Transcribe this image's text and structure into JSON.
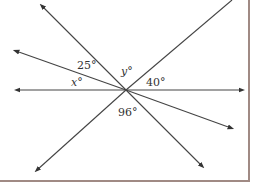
{
  "diagram": {
    "center": [
      126,
      90
    ],
    "line_color": "#444444",
    "border_color": "#a08a84",
    "lines": [
      {
        "name": "horizontal-line",
        "from": [
          17,
          90
        ],
        "to": [
          242,
          90
        ]
      },
      {
        "name": "steep-descending-line",
        "from": [
          42,
          6
        ],
        "to": [
          202,
          166
        ]
      },
      {
        "name": "shallow-descending-line",
        "from": [
          16,
          51
        ],
        "to": [
          231,
          128
        ]
      },
      {
        "name": "ascending-line",
        "from": [
          37,
          170
        ],
        "to": [
          232,
          0
        ]
      }
    ],
    "labels": {
      "angle_25": "25°",
      "angle_y": "y°",
      "angle_40": "40°",
      "angle_x": "x°",
      "angle_96": "96°"
    }
  }
}
